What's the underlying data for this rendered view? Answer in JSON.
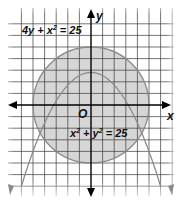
{
  "figure": {
    "axis_labels": {
      "x": "x",
      "y": "y",
      "origin": "O"
    },
    "equations": [
      {
        "id": "parabola",
        "label": "4y + x² = 25",
        "label_parts": [
          "4y + x",
          "2",
          " = 25"
        ]
      },
      {
        "id": "circle",
        "label": "x² + y² = 25",
        "label_parts": [
          "x",
          "2",
          " + y",
          "2",
          " = 25"
        ]
      }
    ],
    "colors": {
      "grid": "#3a3a3a",
      "axis": "#000000",
      "curve": "#8a8a8a",
      "circle_fill": "#d6d6d6",
      "background": "#ffffff"
    },
    "grid": {
      "unit_px": 11.6,
      "x_range": [
        -7,
        7
      ],
      "y_range": [
        -7,
        7
      ]
    },
    "circle": {
      "center": [
        0,
        0
      ],
      "radius": 5
    },
    "parabola": {
      "vertex": [
        0,
        6.25
      ],
      "opens": "down"
    },
    "intersections": [
      [
        -3,
        4
      ],
      [
        3,
        4
      ],
      [
        -5,
        0
      ],
      [
        5,
        0
      ]
    ]
  }
}
